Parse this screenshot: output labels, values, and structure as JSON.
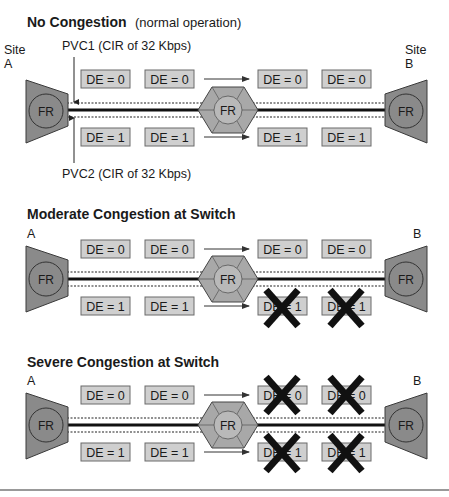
{
  "sections": [
    {
      "title": "No Congestion",
      "subtitle": "(normal operation)",
      "site_a_label": "Site",
      "site_a_letter": "A",
      "site_b_label": "Site",
      "site_b_letter": "B",
      "pvc1_label": "PVC1 (CIR of 32 Kbps)",
      "pvc2_label": "PVC2 (CIR of 32 Kbps)",
      "router_label": "FR",
      "switch_label": "FR",
      "top_frames": [
        "DE = 0",
        "DE = 0",
        "DE = 0",
        "DE = 0"
      ],
      "bottom_frames": [
        "DE = 1",
        "DE = 1",
        "DE = 1",
        "DE = 1"
      ],
      "dropped_top": [
        false,
        false
      ],
      "dropped_bottom": [
        false,
        false
      ]
    },
    {
      "title": "Moderate Congestion at Switch",
      "subtitle": "",
      "site_a_letter": "A",
      "site_b_letter": "B",
      "router_label": "FR",
      "switch_label": "FR",
      "top_frames": [
        "DE = 0",
        "DE = 0",
        "DE = 0",
        "DE = 0"
      ],
      "bottom_frames": [
        "DE = 1",
        "DE = 1",
        "DE = 1",
        "DE = 1"
      ],
      "dropped_top": [
        false,
        false
      ],
      "dropped_bottom": [
        true,
        true
      ]
    },
    {
      "title": "Severe Congestion at Switch",
      "subtitle": "",
      "site_a_letter": "A",
      "site_b_letter": "B",
      "router_label": "FR",
      "switch_label": "FR",
      "top_frames": [
        "DE = 0",
        "DE = 0",
        "DE = 0",
        "DE = 0"
      ],
      "bottom_frames": [
        "DE = 1",
        "DE = 1",
        "DE = 1",
        "DE = 1"
      ],
      "dropped_top": [
        true,
        true
      ],
      "dropped_bottom": [
        true,
        true
      ]
    }
  ],
  "colors": {
    "router_fill": "#8a8a8a",
    "switch_fill": "#a8a8a8",
    "frame_fill": "#cfcfcf",
    "drop_mark": "#111111"
  }
}
